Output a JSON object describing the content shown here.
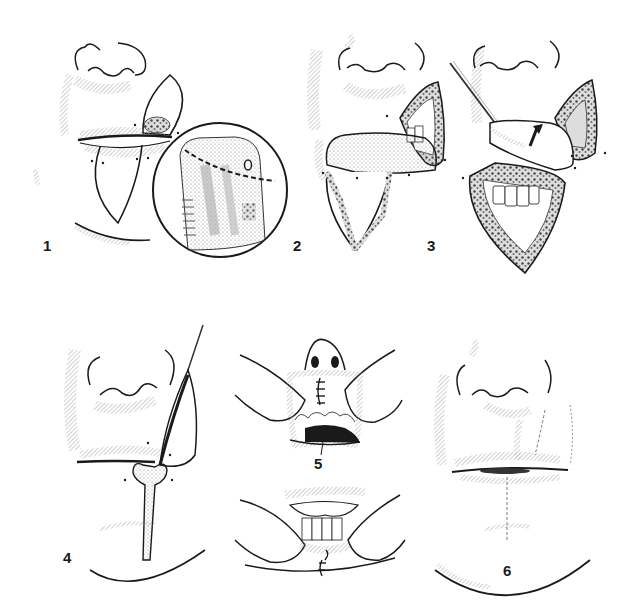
{
  "figure": {
    "panels": [
      {
        "id": 1,
        "label": "1",
        "description": "Lesion on upper lip marked with wedge excision; lower lip flap outlined; circular inset shows magnified lesion with dashed excision line"
      },
      {
        "id": 2,
        "label": "2",
        "description": "Upper lip wedge excised exposing teeth; lower lip flap incised"
      },
      {
        "id": 3,
        "label": "3",
        "description": "Lower lip flap lifted and rotated upward (arrow) with instrument into upper lip defect"
      },
      {
        "id": 4,
        "label": "4",
        "description": "Flap sutured into upper lip with pedicle; lower lip donor site being closed"
      },
      {
        "id": 5,
        "label": "5",
        "description": "Upper: sutured upper lip viewed from inside with lip retracted. Lower: lower lip inner mucosa sutured, retracted"
      },
      {
        "id": 6,
        "label": "6",
        "description": "Final healed result with faint scar lines on upper and lower lip"
      }
    ],
    "colors": {
      "ink": "#1a1a1a",
      "hatch": "#8a8a8a",
      "background": "#ffffff"
    }
  }
}
